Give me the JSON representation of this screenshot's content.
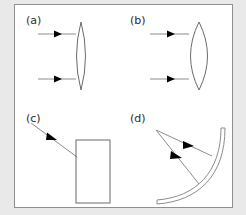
{
  "figure": {
    "background_color": "#e9e9e9",
    "panel_background_color": "#ffffff",
    "frame_color": "#8f8f8f",
    "ray_color": "#8c8c8c",
    "arrow_color": "#000000",
    "optic_color": "#6b6b6b"
  },
  "panels": [
    {
      "id": "a",
      "label": "(a)",
      "label_x": 26,
      "label_y": 24,
      "optic": "thin-biconvex-lens",
      "ray_count": 2,
      "ray_direction": "rightward-horizontal"
    },
    {
      "id": "b",
      "label": "(b)",
      "label_x": 130,
      "label_y": 24,
      "optic": "thick-biconvex-lens",
      "ray_count": 2,
      "ray_direction": "rightward-horizontal"
    },
    {
      "id": "c",
      "label": "(c)",
      "label_x": 26,
      "label_y": 122,
      "optic": "rectangular-block",
      "ray_count": 1,
      "ray_direction": "diagonal-down-right"
    },
    {
      "id": "d",
      "label": "(d)",
      "label_x": 130,
      "label_y": 122,
      "optic": "concave-curved-mirror",
      "ray_count": 2,
      "ray_direction": "diverging-down-right"
    }
  ],
  "geometry": {
    "lens_a": {
      "apex_top_x": 81,
      "apex_top_y": 22,
      "apex_bottom_x": 81,
      "apex_bottom_y": 90,
      "half_width": 9
    },
    "lens_b": {
      "apex_top_x": 199,
      "apex_top_y": 22,
      "apex_bottom_x": 199,
      "apex_bottom_y": 90,
      "half_width": 17
    },
    "rays_a": [
      {
        "x1": 38,
        "y1": 34,
        "x2": 75,
        "y2": 34,
        "arrow_x": 58,
        "arrow_y": 34
      },
      {
        "x1": 38,
        "y1": 79,
        "x2": 75,
        "y2": 79,
        "arrow_x": 58,
        "arrow_y": 79
      }
    ],
    "rays_b": [
      {
        "x1": 150,
        "y1": 34,
        "x2": 188,
        "y2": 34,
        "arrow_x": 172,
        "arrow_y": 34
      },
      {
        "x1": 150,
        "y1": 79,
        "x2": 188,
        "y2": 79,
        "arrow_x": 172,
        "arrow_y": 79
      }
    ],
    "block_c": {
      "x": 76,
      "y": 140,
      "width": 34,
      "height": 63
    },
    "ray_c": {
      "x1": 31,
      "y1": 123,
      "x2": 77,
      "y2": 157,
      "arrow_x": 53,
      "arrow_y": 139
    },
    "rays_d": [
      {
        "x1": 156,
        "y1": 130,
        "x2": 211,
        "y2": 155,
        "arrow_x": 188,
        "arrow_y": 145
      },
      {
        "x1": 156,
        "y1": 130,
        "x2": 198,
        "y2": 183,
        "arrow_x": 177,
        "arrow_y": 157
      }
    ],
    "mirror_d": {
      "start_x": 221,
      "start_y": 128,
      "end_x": 157,
      "end_y": 200,
      "thickness": 3
    }
  }
}
